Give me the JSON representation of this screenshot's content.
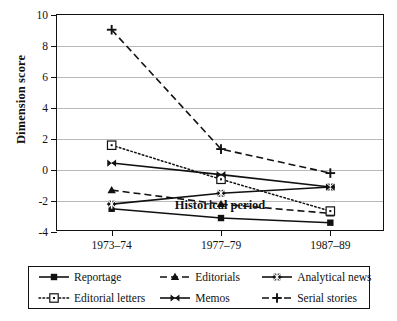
{
  "chart_data": {
    "type": "line",
    "title": "",
    "xlabel": "Historical period",
    "ylabel": "Dimension score",
    "categories": [
      "1973–74",
      "1977–79",
      "1987–89"
    ],
    "ylim": [
      -4,
      10
    ],
    "yticks": [
      -4,
      -2,
      0,
      2,
      4,
      6,
      8,
      10
    ],
    "ytick_labels": [
      "-4",
      "-2",
      "0",
      "2",
      "4",
      "6",
      "8",
      "10"
    ],
    "grid": true,
    "legend_position": "bottom",
    "series": [
      {
        "name": "Reportage",
        "values": [
          -2.5,
          -3.1,
          -3.4
        ],
        "marker": "filled-square",
        "line": "solid"
      },
      {
        "name": "Editorials",
        "values": [
          -1.3,
          -2.2,
          -2.8
        ],
        "marker": "filled-triangle",
        "line": "dashed"
      },
      {
        "name": "Analytical news",
        "values": [
          -2.2,
          -1.5,
          -1.1
        ],
        "marker": "asterisk",
        "line": "solid"
      },
      {
        "name": "Editorial letters",
        "values": [
          1.6,
          -0.6,
          -2.65
        ],
        "marker": "open-square",
        "line": "dotted"
      },
      {
        "name": "Memos",
        "values": [
          0.45,
          -0.3,
          -1.1
        ],
        "marker": "bowtie",
        "line": "solid"
      },
      {
        "name": "Serial stories",
        "values": [
          9.05,
          1.35,
          -0.2
        ],
        "marker": "plus",
        "line": "dashed"
      }
    ]
  },
  "legend": {
    "rows": [
      [
        {
          "label": "Reportage",
          "marker": "filled-square",
          "line": "solid"
        },
        {
          "label": "Editorials",
          "marker": "filled-triangle",
          "line": "dashed"
        },
        {
          "label": "Analytical news",
          "marker": "asterisk",
          "line": "solid"
        }
      ],
      [
        {
          "label": "Editorial letters",
          "marker": "open-square",
          "line": "dotted"
        },
        {
          "label": "Memos",
          "marker": "bowtie",
          "line": "solid"
        },
        {
          "label": "Serial stories",
          "marker": "plus",
          "line": "dashed"
        }
      ]
    ]
  },
  "colors": {
    "ink": "#111111",
    "grid": "#b9b9b9",
    "paper": "#ffffff"
  }
}
